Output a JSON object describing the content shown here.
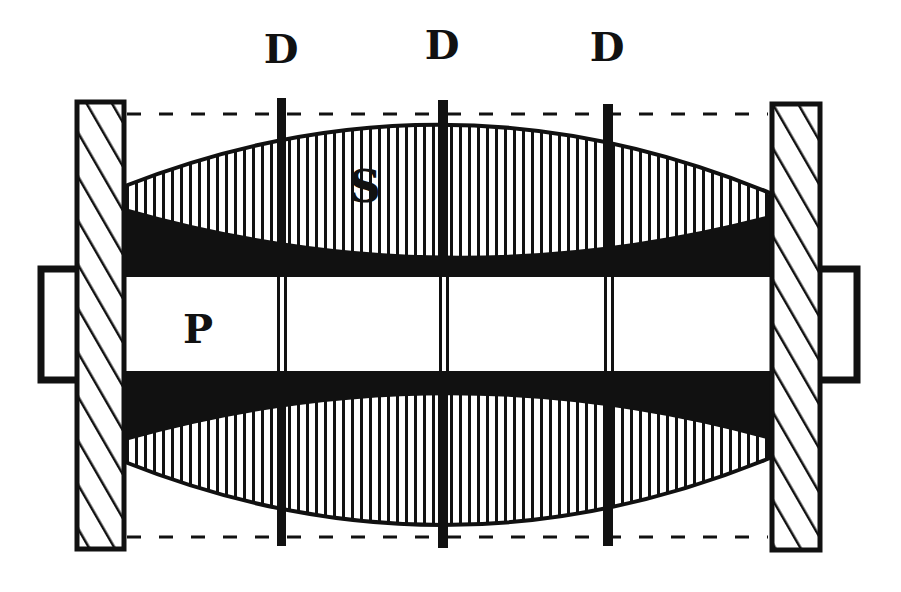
{
  "diagram": {
    "labels": {
      "rods": [
        "D",
        "D",
        "D"
      ],
      "solenoid": "S",
      "core": "P"
    },
    "colors": {
      "ink": "#111111",
      "paper": "#ffffff"
    },
    "parts": {
      "left_plate": "hatched end plate (left)",
      "right_plate": "hatched end plate (right)",
      "upper_winding": "vertically hatched lens-shaped winding (upper)",
      "lower_winding": "vertically hatched lens-shaped winding (lower)",
      "core_bar": "central bar P",
      "rods": "three vertical dividers D"
    }
  }
}
